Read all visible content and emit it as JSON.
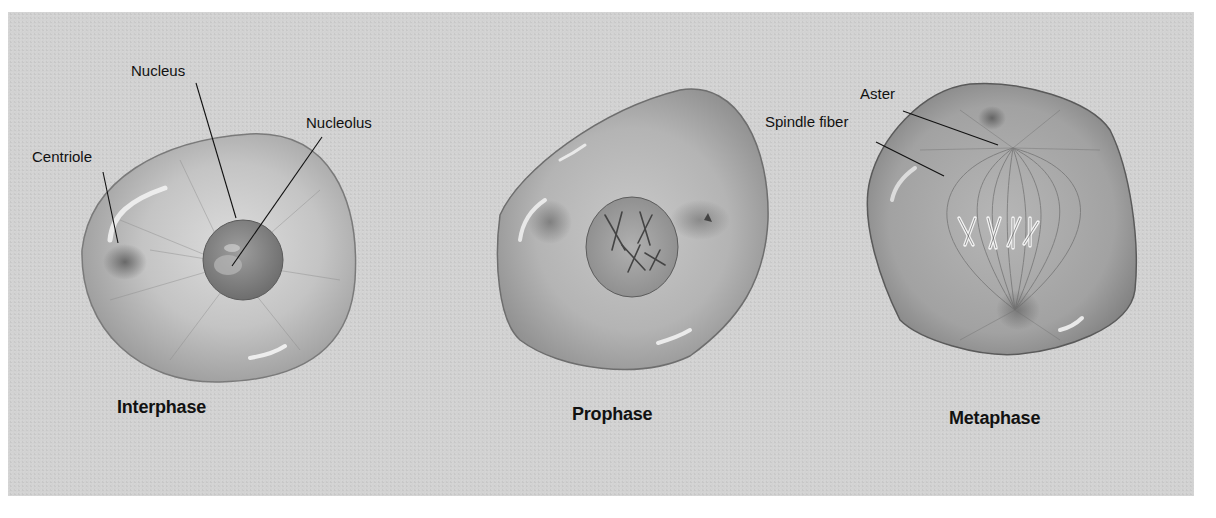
{
  "diagram": {
    "type": "cell-division-stages",
    "background_color": "#d2d2d2",
    "stages": [
      {
        "name": "Interphase",
        "labels": [
          "Centriole",
          "Nucleus",
          "Nucleolus"
        ]
      },
      {
        "name": "Prophase",
        "labels": []
      },
      {
        "name": "Metaphase",
        "labels": [
          "Aster",
          "Spindle fiber"
        ]
      }
    ]
  },
  "labels": {
    "centriole": "Centriole",
    "nucleus": "Nucleus",
    "nucleolus": "Nucleolus",
    "aster": "Aster",
    "spindle_fiber": "Spindle fiber"
  },
  "phases": {
    "interphase": "Interphase",
    "prophase": "Prophase",
    "metaphase": "Metaphase"
  }
}
